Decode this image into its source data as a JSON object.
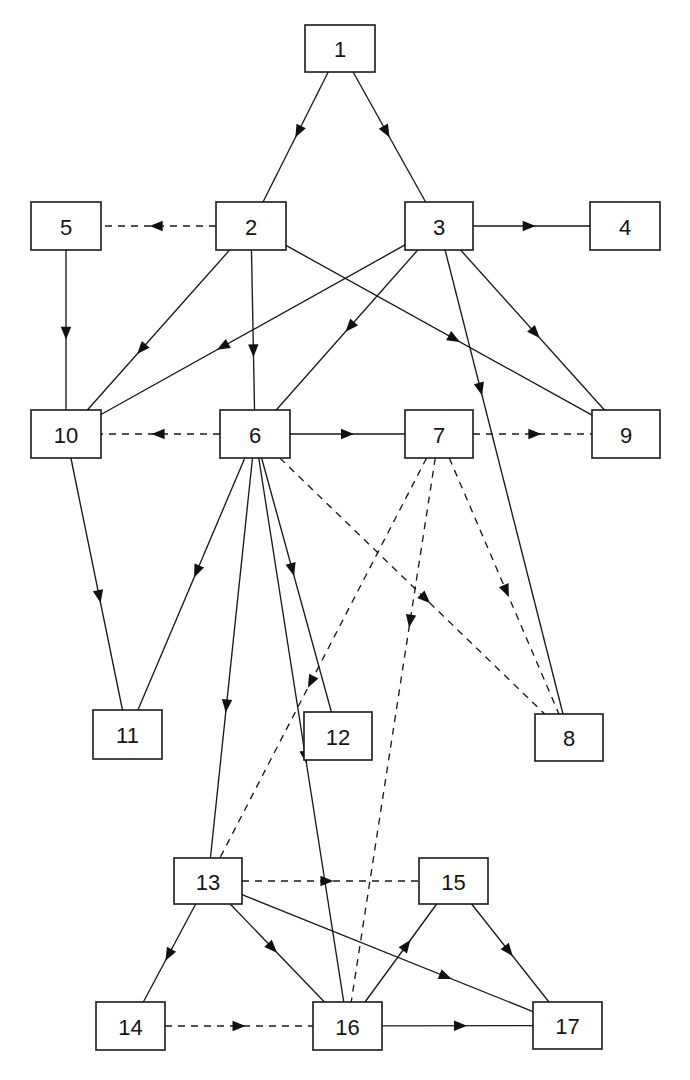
{
  "diagram": {
    "type": "node-link-diagram",
    "canvas": {
      "width": 690,
      "height": 1080
    },
    "colors": {
      "background": "#ffffff",
      "node_fill": "#ffffff",
      "node_stroke": "#1a1a1a",
      "edge": "#1a1a1a",
      "label": "#141414"
    },
    "legend": {
      "solid_edge_meaning": "solid-directed-edge",
      "dashed_edge_meaning": "dashed-directed-edge"
    },
    "nodes": [
      {
        "id": "1",
        "label": "1",
        "x": 305,
        "y": 25,
        "w": 70,
        "h": 47
      },
      {
        "id": "2",
        "label": "2",
        "x": 216,
        "y": 202,
        "w": 70,
        "h": 48
      },
      {
        "id": "3",
        "label": "3",
        "x": 405,
        "y": 202,
        "w": 68,
        "h": 48
      },
      {
        "id": "4",
        "label": "4",
        "x": 590,
        "y": 202,
        "w": 70,
        "h": 48
      },
      {
        "id": "5",
        "label": "5",
        "x": 31,
        "y": 202,
        "w": 70,
        "h": 48
      },
      {
        "id": "6",
        "label": "6",
        "x": 220,
        "y": 410,
        "w": 70,
        "h": 48
      },
      {
        "id": "7",
        "label": "7",
        "x": 405,
        "y": 410,
        "w": 68,
        "h": 48
      },
      {
        "id": "8",
        "label": "8",
        "x": 535,
        "y": 714,
        "w": 68,
        "h": 47
      },
      {
        "id": "9",
        "label": "9",
        "x": 592,
        "y": 410,
        "w": 68,
        "h": 48
      },
      {
        "id": "10",
        "label": "10",
        "x": 31,
        "y": 410,
        "w": 70,
        "h": 48
      },
      {
        "id": "11",
        "label": "11",
        "x": 93,
        "y": 710,
        "w": 69,
        "h": 49
      },
      {
        "id": "12",
        "label": "12",
        "x": 304,
        "y": 712,
        "w": 68,
        "h": 48
      },
      {
        "id": "13",
        "label": "13",
        "x": 174,
        "y": 858,
        "w": 68,
        "h": 46
      },
      {
        "id": "14",
        "label": "14",
        "x": 96,
        "y": 1002,
        "w": 69,
        "h": 48
      },
      {
        "id": "15",
        "label": "15",
        "x": 419,
        "y": 858,
        "w": 69,
        "h": 46
      },
      {
        "id": "16",
        "label": "16",
        "x": 313,
        "y": 1002,
        "w": 69,
        "h": 48
      },
      {
        "id": "17",
        "label": "17",
        "x": 533,
        "y": 1002,
        "w": 69,
        "h": 47
      }
    ],
    "edges": [
      {
        "from": "1",
        "to": "2",
        "style": "solid",
        "arrow_at": 0.46
      },
      {
        "from": "1",
        "to": "3",
        "style": "solid",
        "arrow_at": 0.46
      },
      {
        "from": "2",
        "to": "5",
        "style": "dashed",
        "arrow_at": 0.52
      },
      {
        "from": "3",
        "to": "4",
        "style": "solid",
        "arrow_at": 0.48
      },
      {
        "from": "5",
        "to": "10",
        "style": "solid",
        "arrow_at": 0.52
      },
      {
        "from": "2",
        "to": "10",
        "style": "solid",
        "arrow_at": 0.62
      },
      {
        "from": "2",
        "to": "6",
        "style": "solid",
        "arrow_at": 0.63
      },
      {
        "from": "2",
        "to": "9",
        "style": "solid",
        "arrow_at": 0.55
      },
      {
        "from": "3",
        "to": "6",
        "style": "solid",
        "arrow_at": 0.48
      },
      {
        "from": "3",
        "to": "10",
        "style": "solid",
        "arrow_at": 0.6
      },
      {
        "from": "3",
        "to": "9",
        "style": "solid",
        "arrow_at": 0.52
      },
      {
        "from": "3",
        "to": "8",
        "style": "solid",
        "arrow_at": 0.3
      },
      {
        "from": "6",
        "to": "10",
        "style": "dashed",
        "arrow_at": 0.52
      },
      {
        "from": "6",
        "to": "7",
        "style": "solid",
        "arrow_at": 0.5
      },
      {
        "from": "7",
        "to": "9",
        "style": "dashed",
        "arrow_at": 0.52
      },
      {
        "from": "6",
        "to": "11",
        "style": "solid",
        "arrow_at": 0.45
      },
      {
        "from": "6",
        "to": "13",
        "style": "solid",
        "arrow_at": 0.62
      },
      {
        "from": "6",
        "to": "12",
        "style": "solid",
        "arrow_at": 0.44
      },
      {
        "from": "6",
        "to": "16",
        "style": "solid",
        "arrow_at": 0.55
      },
      {
        "from": "6",
        "to": "8",
        "style": "dashed",
        "arrow_at": 0.55
      },
      {
        "from": "7",
        "to": "8",
        "style": "dashed",
        "arrow_at": 0.52
      },
      {
        "from": "7",
        "to": "13",
        "style": "dashed",
        "arrow_at": 0.56
      },
      {
        "from": "7",
        "to": "16",
        "style": "dashed",
        "arrow_at": 0.3
      },
      {
        "from": "10",
        "to": "11",
        "style": "solid",
        "arrow_at": 0.55
      },
      {
        "from": "13",
        "to": "14",
        "style": "solid",
        "arrow_at": 0.52
      },
      {
        "from": "13",
        "to": "16",
        "style": "solid",
        "arrow_at": 0.45
      },
      {
        "from": "13",
        "to": "17",
        "style": "solid",
        "arrow_at": 0.7
      },
      {
        "from": "13",
        "to": "15",
        "style": "dashed",
        "arrow_at": 0.48
      },
      {
        "from": "16",
        "to": "15",
        "style": "solid",
        "arrow_at": 0.58
      },
      {
        "from": "15",
        "to": "17",
        "style": "solid",
        "arrow_at": 0.48
      },
      {
        "from": "14",
        "to": "16",
        "style": "dashed",
        "arrow_at": 0.5
      },
      {
        "from": "16",
        "to": "17",
        "style": "solid",
        "arrow_at": 0.52
      }
    ]
  }
}
